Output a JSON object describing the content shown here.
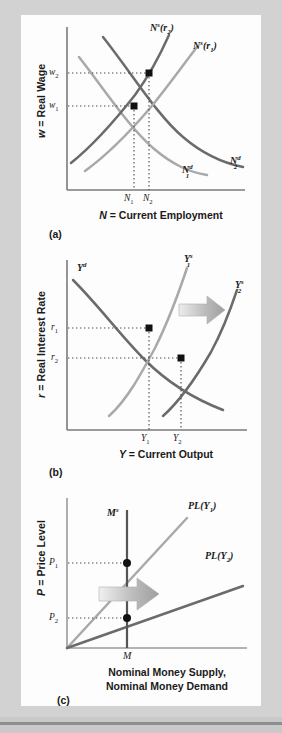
{
  "figure": {
    "type": "economics-diagram",
    "background_color": "#c9c9c9",
    "plate_color": "#fdfdfd",
    "panels": [
      {
        "id": "a",
        "caption": "(a)",
        "y_axis_title": "w = Real Wage",
        "x_axis_title": "N = Current Employment",
        "y_ticks": [
          "w2",
          "w1"
        ],
        "y_tick_labels": [
          "w",
          "w"
        ],
        "y_tick_subs": [
          "2",
          "1"
        ],
        "x_ticks": [
          "N1",
          "N2"
        ],
        "x_tick_labels": [
          "N",
          "N"
        ],
        "x_tick_subs": [
          "1",
          "2"
        ],
        "curves": [
          {
            "name": "labor-supply-r2",
            "label_main": "N",
            "label_sup": "s",
            "label_paren": "(r",
            "label_sub": "2",
            "label_close": ")",
            "color": "#6b6b6b"
          },
          {
            "name": "labor-supply-r1",
            "label_main": "N",
            "label_sup": "s",
            "label_paren": "(r",
            "label_sub": "1",
            "label_close": ")",
            "color": "#a9a9a9"
          },
          {
            "name": "labor-demand-1",
            "label_main": "N",
            "label_sup": "d",
            "label_sub": "1",
            "color": "#a9a9a9"
          },
          {
            "name": "labor-demand-2",
            "label_main": "N",
            "label_sup": "d",
            "label_sub": "2",
            "color": "#6b6b6b"
          }
        ],
        "equilibria": [
          {
            "name": "equilibrium-1",
            "x_label": "N1",
            "y_label": "w1"
          },
          {
            "name": "equilibrium-2",
            "x_label": "N2",
            "y_label": "w2"
          }
        ]
      },
      {
        "id": "b",
        "caption": "(b)",
        "y_axis_title": "r = Real Interest Rate",
        "x_axis_title": "Y = Current Output",
        "y_ticks": [
          "r1",
          "r2"
        ],
        "x_ticks": [
          "Y1",
          "Y2"
        ],
        "curves": [
          {
            "name": "output-demand",
            "label_main": "Y",
            "label_sup": "d",
            "color": "#6b6b6b"
          },
          {
            "name": "output-supply-1",
            "label_main": "Y",
            "label_sup": "s",
            "label_sub": "1",
            "color": "#a9a9a9"
          },
          {
            "name": "output-supply-2",
            "label_main": "Y",
            "label_sup": "s",
            "label_sub": "2",
            "color": "#6b6b6b"
          }
        ],
        "shift_arrow": {
          "name": "rightward-shift-arrow",
          "direction": "right",
          "color": "#b5b5b5"
        },
        "equilibria": [
          {
            "name": "equilibrium-1",
            "x_label": "Y1",
            "y_label": "r1"
          },
          {
            "name": "equilibrium-2",
            "x_label": "Y2",
            "y_label": "r2"
          }
        ]
      },
      {
        "id": "c",
        "caption": "(c)",
        "y_axis_title": "P = Price Level",
        "x_axis_title_line1": "Nominal Money Supply,",
        "x_axis_title_line2": "Nominal Money Demand",
        "y_ticks": [
          "P1",
          "P2"
        ],
        "x_ticks": [
          "M"
        ],
        "curves": [
          {
            "name": "money-supply",
            "label_main": "M",
            "label_sup": "s",
            "color": "#555555"
          },
          {
            "name": "price-level-Y1",
            "label_main": "PL(Y",
            "label_sub": "1",
            "label_close": ")",
            "color": "#a9a9a9"
          },
          {
            "name": "price-level-Y2",
            "label_main": "PL(Y",
            "label_sub": "2",
            "label_close": ")",
            "color": "#6b6b6b"
          }
        ],
        "shift_arrow": {
          "name": "rightward-shift-arrow",
          "direction": "right",
          "color": "#b5b5b5"
        },
        "equilibria": [
          {
            "name": "equilibrium-1",
            "x_label": "M",
            "y_label": "P1"
          },
          {
            "name": "equilibrium-2",
            "x_label": "M",
            "y_label": "P2"
          }
        ]
      }
    ]
  }
}
